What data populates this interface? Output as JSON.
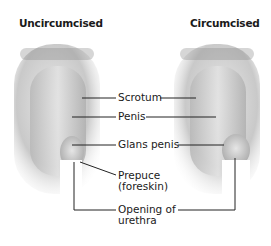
{
  "diagram": {
    "left_title": "Uncircumcised",
    "right_title": "Circumcised",
    "labels": {
      "scrotum": "Scrotum",
      "penis": "Penis",
      "glans": "Glans penis",
      "prepuce_line1": "Prepuce",
      "prepuce_line2": "(foreskin)",
      "opening_line1": "Opening of",
      "opening_line2": "urethra"
    }
  }
}
